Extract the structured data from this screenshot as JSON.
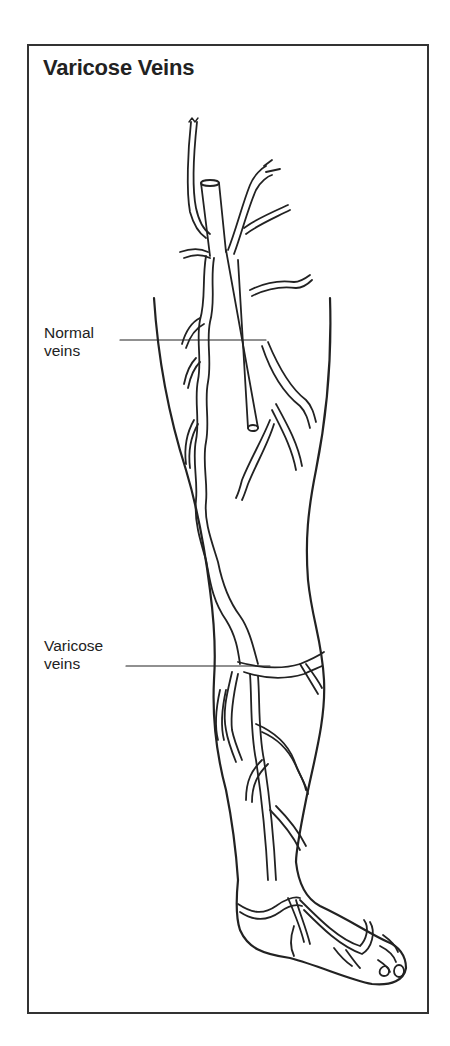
{
  "figure": {
    "title": "Varicose Veins",
    "labels": [
      {
        "id": "normal",
        "line1": "Normal",
        "line2": "veins"
      },
      {
        "id": "varicose",
        "line1": "Varicose",
        "line2": "veins"
      }
    ],
    "colors": {
      "ink": "#222222",
      "background": "#ffffff",
      "frame": "#333333"
    }
  }
}
